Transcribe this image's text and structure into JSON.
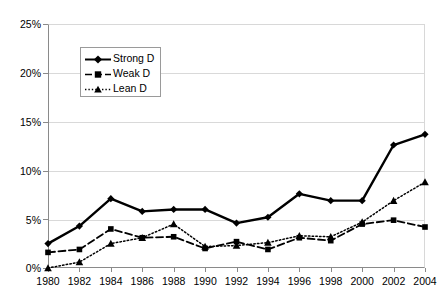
{
  "chart_data": {
    "type": "line",
    "title": "",
    "subtitle": "",
    "xlabel": "",
    "ylabel": "",
    "x": [
      1980,
      1982,
      1984,
      1986,
      1988,
      1990,
      1992,
      1994,
      1996,
      1998,
      2000,
      2002,
      2004
    ],
    "categories": [
      "1980",
      "1982",
      "1984",
      "1986",
      "1988",
      "1990",
      "1992",
      "1994",
      "1996",
      "1998",
      "2000",
      "2002",
      "2004"
    ],
    "xlim": [
      1980,
      2004
    ],
    "ylim": [
      0,
      25
    ],
    "ytick_values": [
      0,
      5,
      10,
      15,
      20,
      25
    ],
    "ytick_labels": [
      "0%",
      "5%",
      "10%",
      "15%",
      "20%",
      "25%"
    ],
    "grid": "horizontal",
    "legend_position": "upper-left-inside",
    "series": [
      {
        "name": "Strong D",
        "marker": "diamond",
        "linestyle": "solid",
        "color": "#000000",
        "values": [
          2.5,
          4.3,
          7.1,
          5.8,
          6.0,
          6.0,
          4.6,
          5.2,
          7.6,
          6.9,
          6.9,
          12.6,
          13.7
        ]
      },
      {
        "name": "Weak D",
        "marker": "square",
        "linestyle": "dashed",
        "color": "#000000",
        "values": [
          1.6,
          1.9,
          4.0,
          3.1,
          3.2,
          2.0,
          2.7,
          1.9,
          3.1,
          2.8,
          4.5,
          4.9,
          4.2
        ]
      },
      {
        "name": "Lean D",
        "marker": "triangle",
        "linestyle": "dotted",
        "color": "#000000",
        "values": [
          0.0,
          0.6,
          2.5,
          3.1,
          4.5,
          2.2,
          2.3,
          2.6,
          3.3,
          3.2,
          4.7,
          6.9,
          8.8
        ]
      }
    ]
  },
  "legend": {
    "items": [
      {
        "label": "Strong D"
      },
      {
        "label": "Weak D"
      },
      {
        "label": "Lean D"
      }
    ]
  },
  "axes": {
    "y_labels": [
      "25%",
      "20%",
      "15%",
      "10%",
      "5%",
      "0%"
    ],
    "x_labels": [
      "1980",
      "1982",
      "1984",
      "1986",
      "1988",
      "1990",
      "1992",
      "1994",
      "1996",
      "1998",
      "2000",
      "2002",
      "2004"
    ]
  },
  "colors": {
    "series": "#000000",
    "grid": "#d9d9d9",
    "axis": "#8a8a8a",
    "background": "#ffffff"
  }
}
